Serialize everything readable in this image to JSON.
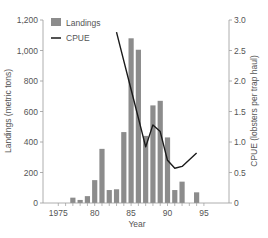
{
  "chart_data": {
    "type": "bar+line",
    "title": "",
    "x": [
      1975,
      1976,
      1977,
      1978,
      1979,
      1980,
      1981,
      1982,
      1983,
      1984,
      1985,
      1986,
      1987,
      1988,
      1989,
      1990,
      1991,
      1992,
      1993,
      1994,
      1995
    ],
    "xlabel": "Year",
    "xticks": [
      1975,
      1980,
      1985,
      1990,
      1995
    ],
    "xtick_labels": [
      "1975",
      "80",
      "85",
      "90",
      "95"
    ],
    "xlim": [
      1974.2,
      1995.8
    ],
    "series": [
      {
        "name": "Landings",
        "type": "bar",
        "axis": "left",
        "color": "#8c8c8c",
        "x": [
          1977,
          1978,
          1979,
          1980,
          1981,
          1982,
          1983,
          1984,
          1985,
          1986,
          1987,
          1988,
          1989,
          1990,
          1991,
          1992,
          1994
        ],
        "values": [
          35,
          20,
          45,
          150,
          355,
          85,
          90,
          465,
          1080,
          1005,
          440,
          640,
          670,
          430,
          85,
          140,
          70
        ]
      },
      {
        "name": "CPUE",
        "type": "line",
        "axis": "right",
        "color": "#1a1a1a",
        "x": [
          1983,
          1984,
          1985,
          1986,
          1987,
          1988,
          1989,
          1990,
          1991,
          1992,
          1994
        ],
        "values": [
          2.8,
          2.33,
          1.86,
          1.39,
          0.92,
          1.28,
          1.17,
          0.7,
          0.57,
          0.6,
          0.82
        ]
      }
    ],
    "ylabel": "Landings (metric tons)",
    "ylim": [
      0,
      1200
    ],
    "yticks": [
      0,
      200,
      400,
      600,
      800,
      1000,
      1200
    ],
    "ytick_labels": [
      "0",
      "200",
      "400",
      "600",
      "800",
      "1,000",
      "1,200"
    ],
    "y2label": "CPUE (lobsters per trap haul)",
    "y2lim": [
      0,
      3.0
    ],
    "y2ticks": [
      0,
      0.5,
      1.0,
      1.5,
      2.0,
      2.5,
      3.0
    ],
    "y2tick_labels": [
      "0",
      "0.5",
      "1.0",
      "1.5",
      "2.0",
      "2.5",
      "3.0"
    ],
    "grid": false,
    "legend": {
      "position": "upper-left",
      "entries": [
        {
          "label": "Landings",
          "marker": "square",
          "color": "#8c8c8c"
        },
        {
          "label": "CPUE",
          "marker": "line",
          "color": "#1a1a1a"
        }
      ]
    }
  }
}
